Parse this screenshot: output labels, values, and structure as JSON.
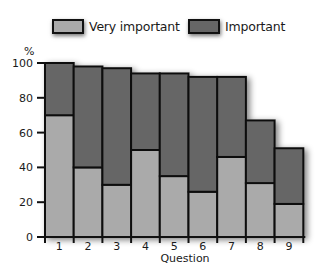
{
  "chart_data": {
    "type": "bar",
    "stacked": true,
    "title": "",
    "xlabel": "Question",
    "ylabel": "%",
    "ylim": [
      0,
      100
    ],
    "yticks": [
      0,
      20,
      40,
      60,
      80,
      100
    ],
    "grid": false,
    "legend_position": "top",
    "categories": [
      "1",
      "2",
      "3",
      "4",
      "5",
      "6",
      "7",
      "8",
      "9"
    ],
    "series": [
      {
        "name": "Very important",
        "color": "#aaaaaa",
        "values": [
          70,
          40,
          30,
          50,
          35,
          26,
          46,
          31,
          19
        ]
      },
      {
        "name": "Important",
        "color": "#666666",
        "values": [
          30,
          58,
          67,
          44,
          59,
          66,
          46,
          36,
          32
        ]
      }
    ],
    "totals": [
      100,
      98,
      97,
      94,
      94,
      92,
      92,
      67,
      51
    ]
  },
  "legend": {
    "items": [
      {
        "label": "Very important",
        "color": "#aaaaaa"
      },
      {
        "label": "Important",
        "color": "#666666"
      }
    ]
  },
  "axes": {
    "y_unit": "%",
    "x_title": "Question"
  }
}
